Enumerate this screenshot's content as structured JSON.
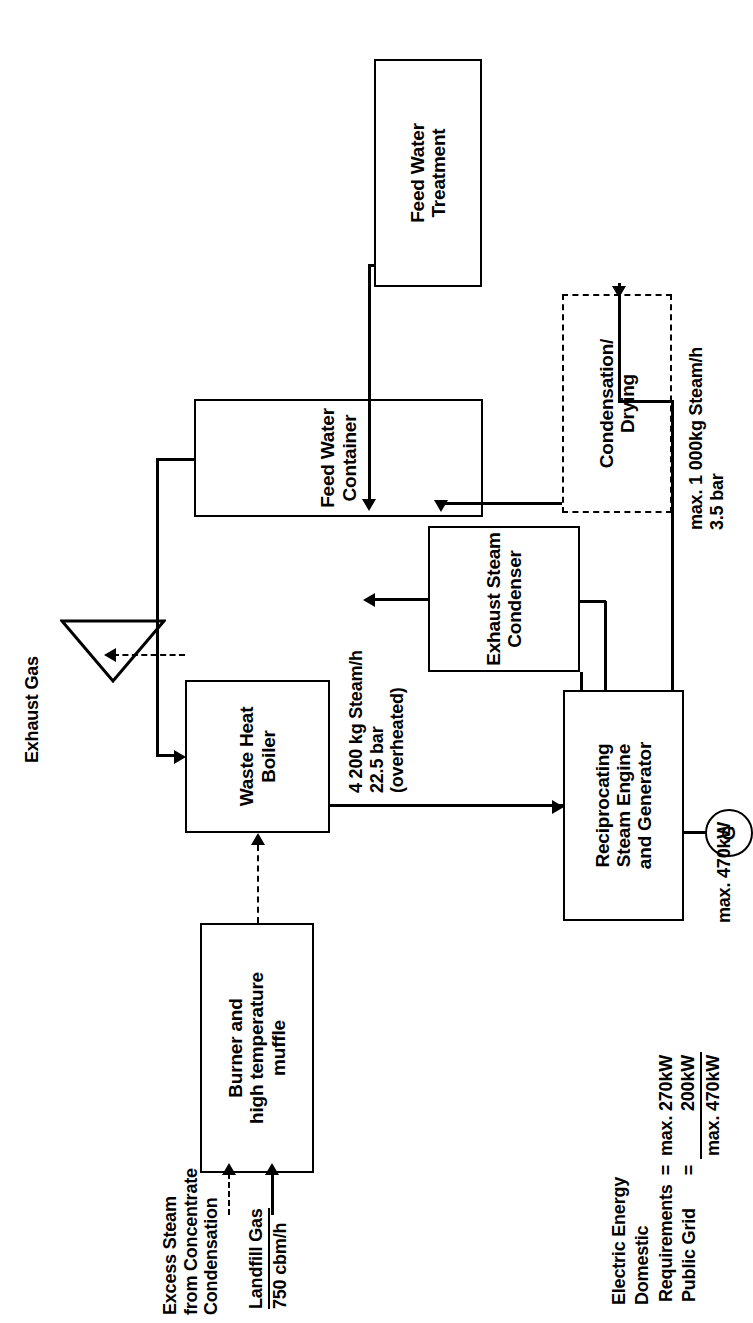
{
  "diagram": {
    "orientation": "rotated-90-ccw",
    "boxes": {
      "burner": "Burner and\nhigh temperature\nmuffle",
      "waste_heat_boiler": "Waste Heat\nBoiler",
      "feed_water_container": "Feed Water\nContainer",
      "feed_water_treatment": "Feed Water\nTreatment",
      "exhaust_steam_condenser": "Exhaust Steam\nCondenser",
      "steam_engine": "Reciprocating\nSteam Engine\nand Generator",
      "condensation_drying": "Condensation/\nDrying"
    },
    "labels": {
      "exhaust_gas": "Exhaust Gas",
      "excess_steam": "Excess Steam\nfrom Concentrate\nCondensation",
      "landfill_gas_name": "Landfill Gas",
      "landfill_gas_rate": "750 cbm/h",
      "hp_steam_line1": "4 200 kg Steam/h",
      "hp_steam_line2": "22.5 bar",
      "hp_steam_line3": "(overheated)",
      "lp_steam_line1": "max. 1 000kg Steam/h",
      "lp_steam_line2": "3.5 bar",
      "generator_output": "max. 470kW",
      "generator_symbol": "G"
    },
    "energy": {
      "heading_line1": "Electric Energy",
      "heading_line2": "Domestic",
      "rows": [
        {
          "name": "Requirements",
          "eq": "=",
          "value": "max. 270kW"
        },
        {
          "name": "Public Grid",
          "eq": "=",
          "value": "200kW"
        }
      ],
      "total": {
        "name": "",
        "eq": "",
        "value": "max. 470kW"
      }
    },
    "colors": {
      "line": "#000000",
      "background": "#ffffff"
    }
  }
}
